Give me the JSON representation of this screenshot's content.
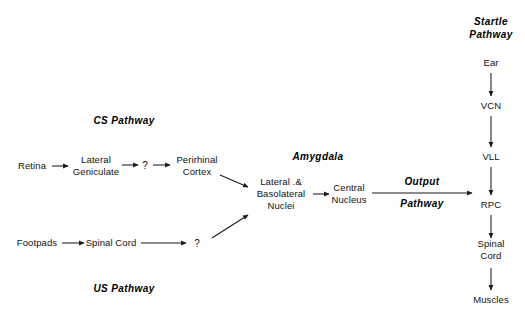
{
  "diagram": {
    "background_color": "#ffffff",
    "line_color": "#1a1a1a",
    "text_color": "#111111"
  },
  "section_labels": [
    {
      "id": "cs",
      "text": "CS  Pathway",
      "x": 124,
      "y": 120
    },
    {
      "id": "us",
      "text": "US  Pathway",
      "x": 124,
      "y": 288
    },
    {
      "id": "amygdala",
      "text": "Amygdala",
      "x": 318,
      "y": 156
    },
    {
      "id": "startle",
      "text": "Startle\nPathway",
      "x": 491,
      "y": 28
    },
    {
      "id": "output",
      "text": "Output",
      "x": 422,
      "y": 181
    },
    {
      "id": "output2",
      "text": "Pathway",
      "x": 422,
      "y": 203
    }
  ],
  "nodes": {
    "cs_pathway": [
      {
        "id": "retina",
        "label": "Retina",
        "x": 32,
        "y": 166
      },
      {
        "id": "lateral-geniculate",
        "label": "Lateral\nGeniculate",
        "x": 96,
        "y": 166
      },
      {
        "id": "cs-question",
        "label": "?",
        "x": 145,
        "y": 165
      },
      {
        "id": "perirhinal-cortex",
        "label": "Perirhinal\nCortex",
        "x": 197,
        "y": 166
      }
    ],
    "us_pathway": [
      {
        "id": "footpads",
        "label": "Footpads",
        "x": 37,
        "y": 243
      },
      {
        "id": "spinal-cord-us",
        "label": "Spinal Cord",
        "x": 111,
        "y": 243
      },
      {
        "id": "us-question",
        "label": "?",
        "x": 197,
        "y": 243
      }
    ],
    "amygdala": [
      {
        "id": "lateral-basolateral-nuclei",
        "label": "Lateral  .&\nBasolateral\nNuclei",
        "x": 281,
        "y": 194
      },
      {
        "id": "central-nucleus",
        "label": "Central\nNucleus",
        "x": 349,
        "y": 194
      }
    ],
    "startle_pathway": [
      {
        "id": "ear",
        "label": "Ear",
        "x": 491,
        "y": 63
      },
      {
        "id": "vcn",
        "label": "VCN",
        "x": 491,
        "y": 106
      },
      {
        "id": "vll",
        "label": "VLL",
        "x": 491,
        "y": 157
      },
      {
        "id": "rpc",
        "label": "RPC",
        "x": 491,
        "y": 205
      },
      {
        "id": "spinal-cord-startle",
        "label": "Spinal\nCord",
        "x": 491,
        "y": 250
      },
      {
        "id": "muscles",
        "label": "Muscles",
        "x": 491,
        "y": 300
      }
    ]
  },
  "edges": [
    {
      "id": "retina-to-lg",
      "from": "retina",
      "to": "lateral-geniculate",
      "x1": 52,
      "y1": 166,
      "x2": 68,
      "y2": 166
    },
    {
      "id": "lg-to-q",
      "from": "lateral-geniculate",
      "to": "cs-question",
      "x1": 122,
      "y1": 165,
      "x2": 138,
      "y2": 165
    },
    {
      "id": "q-to-perirhinal",
      "from": "cs-question",
      "to": "perirhinal-cortex",
      "x1": 153,
      "y1": 165,
      "x2": 170,
      "y2": 165
    },
    {
      "id": "perirhinal-to-lbn",
      "from": "perirhinal-cortex",
      "to": "lateral-basolateral-nuclei",
      "x1": 220,
      "y1": 175,
      "x2": 248,
      "y2": 187
    },
    {
      "id": "footpads-to-sc",
      "from": "footpads",
      "to": "spinal-cord-us",
      "x1": 62,
      "y1": 243,
      "x2": 84,
      "y2": 243
    },
    {
      "id": "sc-to-q",
      "from": "spinal-cord-us",
      "to": "us-question",
      "x1": 141,
      "y1": 243,
      "x2": 186,
      "y2": 243
    },
    {
      "id": "q-to-lbn",
      "from": "us-question",
      "to": "lateral-basolateral-nuclei",
      "x1": 212,
      "y1": 238,
      "x2": 248,
      "y2": 215
    },
    {
      "id": "lbn-to-cn",
      "from": "lateral-basolateral-nuclei",
      "to": "central-nucleus",
      "x1": 313,
      "y1": 194,
      "x2": 329,
      "y2": 194
    },
    {
      "id": "cn-to-rpc",
      "from": "central-nucleus",
      "to": "rpc",
      "x1": 372,
      "y1": 193,
      "x2": 472,
      "y2": 193
    },
    {
      "id": "ear-to-vcn",
      "from": "ear",
      "to": "vcn",
      "x1": 491,
      "y1": 73,
      "x2": 491,
      "y2": 96
    },
    {
      "id": "vcn-to-vll",
      "from": "vcn",
      "to": "vll",
      "x1": 491,
      "y1": 116,
      "x2": 491,
      "y2": 147
    },
    {
      "id": "vll-to-rpc",
      "from": "vll",
      "to": "rpc",
      "x1": 491,
      "y1": 167,
      "x2": 491,
      "y2": 195
    },
    {
      "id": "rpc-to-spinal",
      "from": "rpc",
      "to": "spinal-cord-startle",
      "x1": 491,
      "y1": 215,
      "x2": 491,
      "y2": 238
    },
    {
      "id": "spinal-to-muscles",
      "from": "spinal-cord-startle",
      "to": "muscles",
      "x1": 491,
      "y1": 268,
      "x2": 491,
      "y2": 290
    }
  ]
}
